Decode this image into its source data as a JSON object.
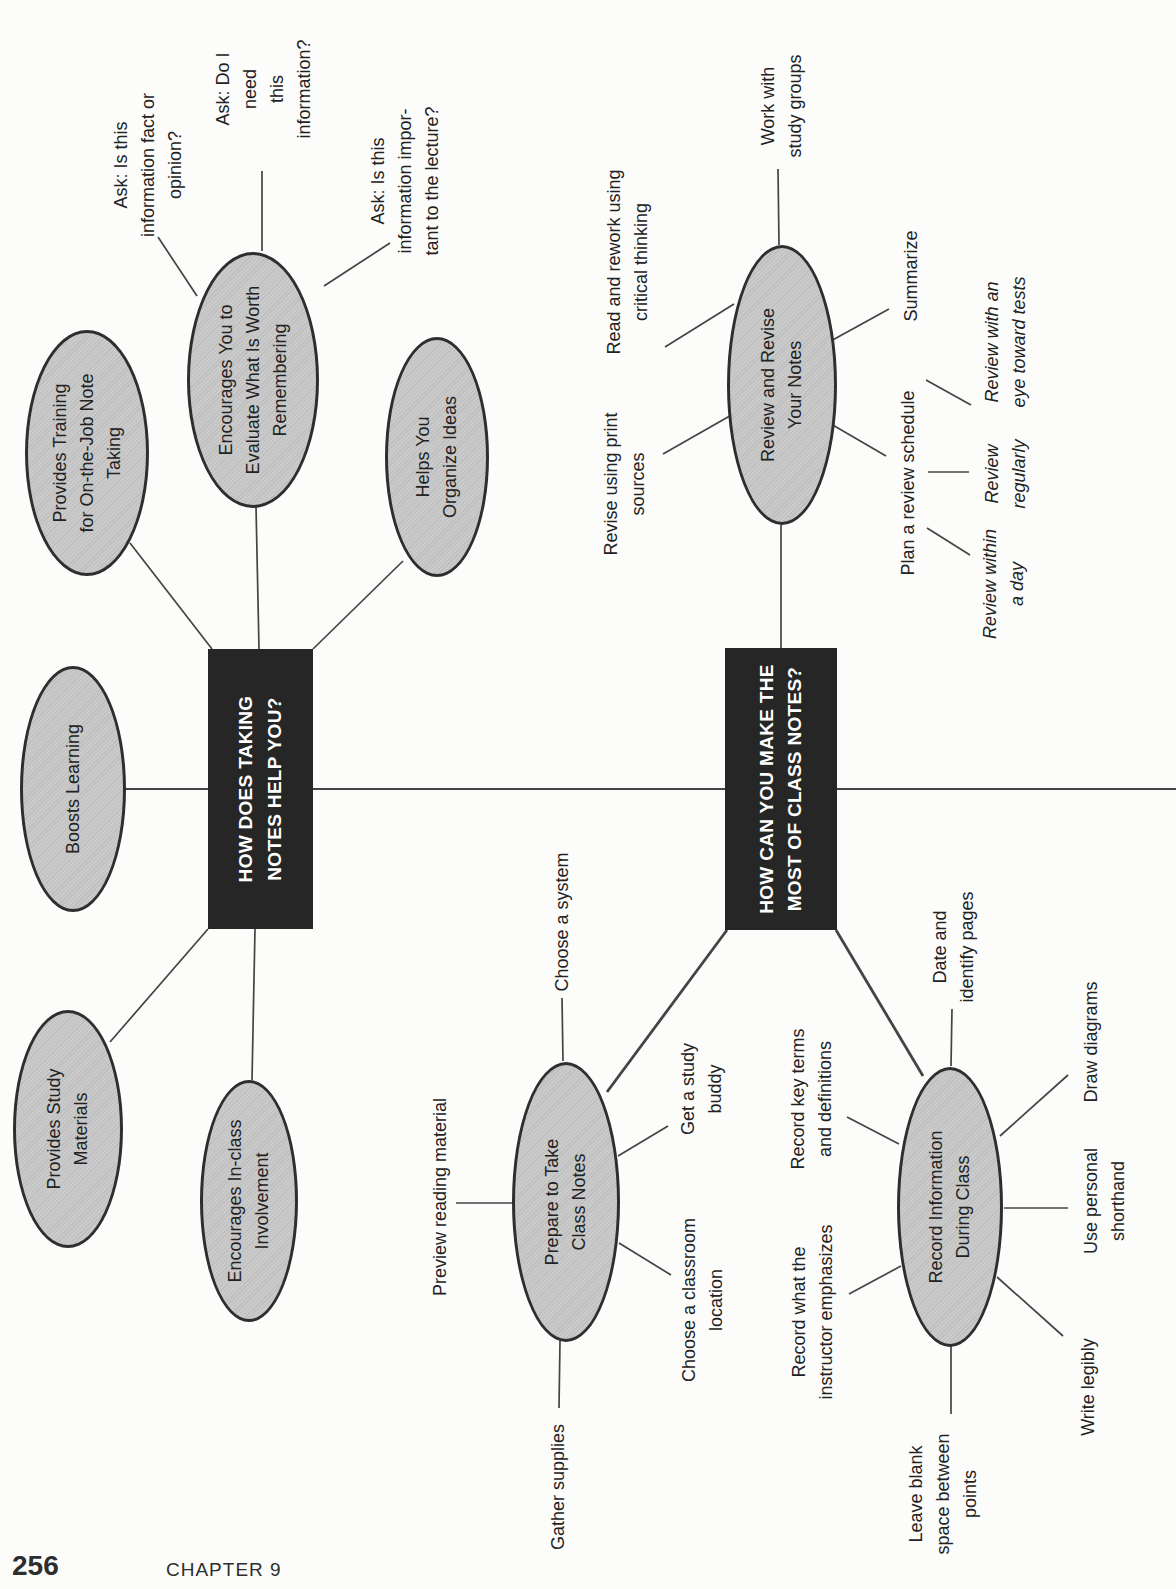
{
  "footer": {
    "page_number": "256",
    "chapter": "CHAPTER 9"
  },
  "colors": {
    "node_fill": "#c8c8c8",
    "node_stroke": "#2e2e2e",
    "box_bg": "#262626",
    "box_text": "#ffffff",
    "line": "#444444"
  },
  "map1": {
    "center_label": "HOW DOES TAKING\nNOTES HELP YOU?",
    "ellipses": {
      "training": "Provides Training\nfor On-the-Job Note\nTaking",
      "evaluate": "Encourages You to\nEvaluate What Is Worth\nRemembering",
      "organize": "Helps You\nOrganize Ideas",
      "boosts": "Boosts Learning",
      "study": "Provides Study\nMaterials",
      "inclass": "Encourages In-class\nInvolvement"
    },
    "labels": {
      "ask_fact": "Ask: Is this\ninformation fact or\nopinion?",
      "ask_need": "Ask: Do I need\nthis information?",
      "ask_important": "Ask: Is this\ninformation impor-\ntant to the lecture?"
    }
  },
  "map2": {
    "center_label": "HOW CAN YOU MAKE THE\nMOST OF CLASS NOTES?",
    "ellipses": {
      "review": "Review and Revise\nYour Notes",
      "prepare": "Prepare to Take\nClass Notes",
      "record": "Record Information\nDuring Class"
    },
    "labels": {
      "work": "Work with\nstudy groups",
      "read": "Read and rework using\ncritical thinking",
      "revise_print": "Revise using print\nsources",
      "summarize": "Summarize",
      "plan": "Plan a review schedule",
      "eye_tests": "Review with an\neye toward tests",
      "regularly": "Review\nregularly",
      "within_day": "Review within\na day",
      "system": "Choose a system",
      "preview": "Preview reading material",
      "buddy": "Get a study\nbuddy",
      "classroom": "Choose a classroom\nlocation",
      "gather": "Gather supplies",
      "date_pages": "Date and\nidentify pages",
      "diagrams": "Draw diagrams",
      "key_terms": "Record key terms\nand definitions",
      "instructor": "Record what the\ninstructor emphasizes",
      "shorthand": "Use personal\nshorthand",
      "legibly": "Write legibly",
      "blank_space": "Leave blank\nspace between\npoints"
    }
  }
}
